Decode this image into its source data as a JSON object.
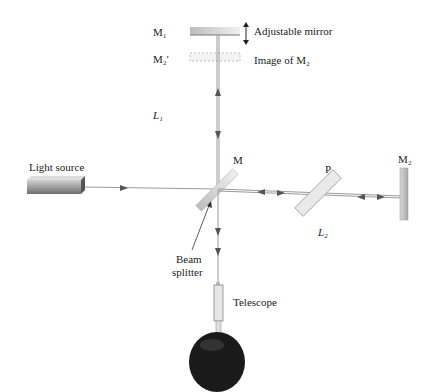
{
  "labels": {
    "m1": "M₁",
    "m1_desc": "Adjustable mirror",
    "m2_image": "M₂′",
    "m2_image_desc": "Image of M₂",
    "l1": "L₁",
    "light_source": "Light source",
    "m": "M",
    "p": "P",
    "m2": "M₂",
    "l2": "L₂",
    "beam_splitter_line1": "Beam",
    "beam_splitter_line2": "splitter",
    "telescope": "Telescope"
  },
  "colors": {
    "beam": "#9a9a9a",
    "arrow": "#555555",
    "mirror": "#c8c8c8",
    "head": "#1a1a1a"
  }
}
